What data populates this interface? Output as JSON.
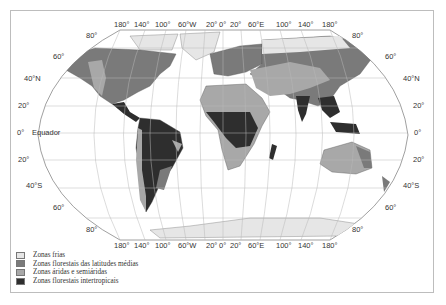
{
  "map": {
    "top_longitudes": [
      "180°",
      "140°",
      "100°",
      "60°W",
      "20°",
      "0°",
      "20°",
      "60°E",
      "100°",
      "140°",
      "180°"
    ],
    "bottom_longitudes": [
      "180°",
      "140°",
      "100°",
      "60°W",
      "20°",
      "0°",
      "20°",
      "60°E",
      "100°",
      "140°",
      "180°"
    ],
    "left_latitudes": [
      "80°",
      "60°",
      "40°N",
      "20°",
      "0°",
      "20°",
      "40°S",
      "60°",
      "80°"
    ],
    "right_latitudes": [
      "80°",
      "60°",
      "40°N",
      "20°",
      "0°",
      "20°",
      "40°S",
      "60°",
      "80°"
    ],
    "equator_label": "Equador",
    "colors": {
      "ocean": "#ffffff",
      "grid": "#b8b8b8",
      "cold": "#e6e6e6",
      "temperate_forest": "#7a7a7a",
      "arid": "#a8a8a8",
      "tropical_forest": "#2e2e2e"
    }
  },
  "legend": {
    "items": [
      {
        "label": "Zonas frias",
        "color": "#e6e6e6"
      },
      {
        "label": "Zonas florestais das latitudes médias",
        "color": "#7a7a7a"
      },
      {
        "label": "Zonas áridas e semiáridas",
        "color": "#a8a8a8"
      },
      {
        "label": "Zonas florestais intertropicais",
        "color": "#2e2e2e"
      }
    ]
  }
}
